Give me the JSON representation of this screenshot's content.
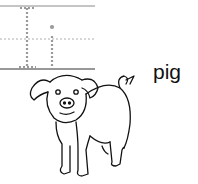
{
  "worksheet": {
    "trace_letters": "li",
    "word": "pig",
    "picture": "pig-illustration"
  },
  "colors": {
    "line": "#555555",
    "dashed_letters": "#9a9a9a",
    "ink": "#111111"
  }
}
